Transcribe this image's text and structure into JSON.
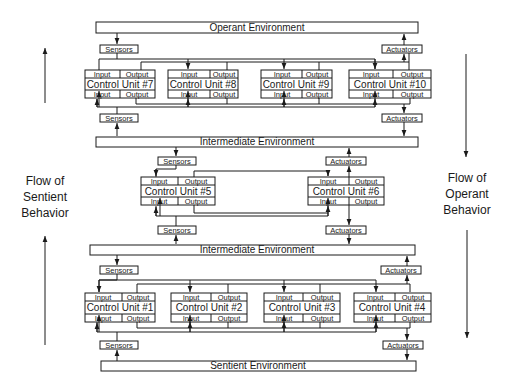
{
  "environments": {
    "operant": "Operant Environment",
    "intermediate_top": "Intermediate Environment",
    "intermediate_bottom": "Intermediate Environment",
    "sentient": "Sentient Environment"
  },
  "labels": {
    "sensors": "Sensors",
    "actuators": "Actuators",
    "input": "Input",
    "output": "Output"
  },
  "units": {
    "u7": "Control Unit #7",
    "u8": "Control Unit #8",
    "u9": "Control Unit #9",
    "u10": "Control Unit #10",
    "u5": "Control Unit #5",
    "u6": "Control Unit #6",
    "u1": "Control Unit #1",
    "u2": "Control Unit #2",
    "u3": "Control Unit #3",
    "u4": "Control Unit #4"
  },
  "side_labels": {
    "left": [
      "Flow of",
      "Sentient",
      "Behavior"
    ],
    "right": [
      "Flow of",
      "Operant",
      "Behavior"
    ]
  }
}
